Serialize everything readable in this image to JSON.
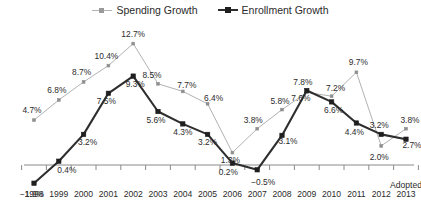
{
  "legend": {
    "position": "top-center",
    "items": [
      {
        "name": "spending-growth",
        "label": "Spending Growth",
        "color": "#b2b2b2"
      },
      {
        "name": "enrollment-growth",
        "label": "Enrollment Growth",
        "color": "#2e2e2e"
      }
    ]
  },
  "axis_note": "Adopted",
  "chart_data": {
    "type": "line",
    "title": "",
    "subtitle": "",
    "xlabel": "",
    "ylabel": "",
    "grid": false,
    "legend_position": "top-center",
    "ylim": [
      -3.0,
      13.5
    ],
    "categories": [
      "1998",
      "1999",
      "2000",
      "2001",
      "2002",
      "2003",
      "2004",
      "2005",
      "2006",
      "2007",
      "2008",
      "2009",
      "2010",
      "2011",
      "2012",
      "2013"
    ],
    "x_tick_labels": [
      "1998",
      "1999",
      "2000",
      "2001",
      "2002",
      "2003",
      "2004",
      "2005",
      "2006",
      "2007",
      "2008",
      "2009",
      "2010",
      "2011",
      "2012",
      "2013"
    ],
    "annotations": [
      {
        "text": "Adopted",
        "at_category": "2013"
      }
    ],
    "series": [
      {
        "name": "Spending Growth",
        "color": "#b2b2b2",
        "values": [
          4.7,
          6.8,
          8.7,
          10.4,
          12.7,
          8.5,
          7.7,
          6.4,
          1.3,
          3.8,
          5.8,
          7.6,
          7.2,
          9.7,
          2.0,
          3.8
        ],
        "labels": [
          "4.7%",
          "6.8%",
          "8.7%",
          "10.4%",
          "12.7%",
          "8.5%",
          "7.7%",
          "6.4%",
          "1.3%",
          "3.8%",
          "5.8%",
          "7.6%",
          "7.2%",
          "9.7%",
          "2.0%",
          "3.8%"
        ]
      },
      {
        "name": "Enrollment Growth",
        "color": "#2e2e2e",
        "values": [
          -1.9,
          0.4,
          3.2,
          7.5,
          9.3,
          5.6,
          4.3,
          3.2,
          0.2,
          -0.5,
          3.1,
          7.8,
          6.6,
          4.4,
          3.2,
          2.7
        ],
        "labels": [
          "−1.9%",
          "0.4%",
          "3.2%",
          "7.5%",
          "9.3%",
          "5.6%",
          "4.3%",
          "3.2%",
          "0.2%",
          "−0.5%",
          "3.1%",
          "7.8%",
          "6.6%",
          "4.4%",
          "3.2%",
          "2.7%"
        ]
      }
    ]
  },
  "label_offsets": {
    "spending": [
      [
        -2,
        -7
      ],
      [
        -2,
        -7
      ],
      [
        -2,
        -7
      ],
      [
        -2,
        -7
      ],
      [
        0,
        -7
      ],
      [
        -6,
        -6
      ],
      [
        4,
        -3
      ],
      [
        6,
        -3
      ],
      [
        -2,
        10
      ],
      [
        -4,
        -6
      ],
      [
        -2,
        -6
      ],
      [
        -6,
        9
      ],
      [
        4,
        -5
      ],
      [
        2,
        -7
      ],
      [
        -2,
        14
      ],
      [
        4,
        -6
      ]
    ],
    "enrollment": [
      [
        -2,
        14
      ],
      [
        8,
        12
      ],
      [
        4,
        11
      ],
      [
        -2,
        11
      ],
      [
        2,
        11
      ],
      [
        -2,
        11
      ],
      [
        0,
        11
      ],
      [
        0,
        11
      ],
      [
        -4,
        12
      ],
      [
        6,
        15
      ],
      [
        6,
        9
      ],
      [
        -4,
        -6
      ],
      [
        2,
        11
      ],
      [
        -2,
        12
      ],
      [
        -2,
        -6
      ],
      [
        6,
        9
      ]
    ]
  }
}
